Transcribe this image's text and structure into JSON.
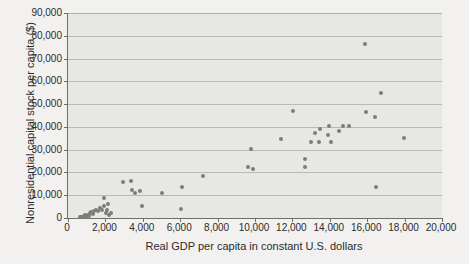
{
  "chart_data": {
    "type": "scatter",
    "title": "",
    "xlabel": "Real GDP per capita in constant U.S. dollars",
    "ylabel": "Nonresidential capital stock per capita ($)",
    "xlim": [
      0,
      20000
    ],
    "ylim": [
      0,
      90000
    ],
    "xticks": [
      0,
      2000,
      4000,
      6000,
      8000,
      10000,
      12000,
      14000,
      16000,
      18000,
      20000
    ],
    "yticks": [
      0,
      10000,
      20000,
      30000,
      40000,
      50000,
      60000,
      70000,
      80000,
      90000
    ],
    "xtick_labels": [
      "0",
      "2,000",
      "4,000",
      "6,000",
      "8,000",
      "10,000",
      "12,000",
      "14,000",
      "16,000",
      "18,000",
      "20,000"
    ],
    "ytick_labels": [
      "0",
      "10,000",
      "20,000",
      "30,000",
      "40,000",
      "50,000",
      "60,000",
      "70,000",
      "80,000",
      "90,000"
    ],
    "grid": true,
    "grid_axis": "y",
    "legend": false,
    "marker_color": "#7d7d7d",
    "plot_background": "#e7e7e4",
    "figure_background": "#f2f1ef",
    "series": [
      {
        "name": "countries",
        "points": [
          [
            620,
            300
          ],
          [
            700,
            500
          ],
          [
            760,
            250
          ],
          [
            860,
            700
          ],
          [
            900,
            1100
          ],
          [
            980,
            600
          ],
          [
            1050,
            1500
          ],
          [
            1120,
            900
          ],
          [
            1180,
            2100
          ],
          [
            1250,
            2600
          ],
          [
            1320,
            1800
          ],
          [
            1400,
            3000
          ],
          [
            1500,
            3500
          ],
          [
            1580,
            2900
          ],
          [
            1700,
            4200
          ],
          [
            1800,
            3300
          ],
          [
            1900,
            8700
          ],
          [
            1950,
            5400
          ],
          [
            2050,
            2200
          ],
          [
            2100,
            3400
          ],
          [
            2150,
            6100
          ],
          [
            2200,
            1500
          ],
          [
            2300,
            2400
          ],
          [
            2950,
            15800
          ],
          [
            3350,
            16200
          ],
          [
            3400,
            12300
          ],
          [
            3600,
            10900
          ],
          [
            3850,
            11700
          ],
          [
            3950,
            5300
          ],
          [
            5000,
            11000
          ],
          [
            6050,
            3900
          ],
          [
            6100,
            13500
          ],
          [
            7200,
            18600
          ],
          [
            9600,
            22300
          ],
          [
            9800,
            30200
          ],
          [
            9900,
            21400
          ],
          [
            11400,
            34700
          ],
          [
            12050,
            46800
          ],
          [
            12650,
            26100
          ],
          [
            12700,
            22200
          ],
          [
            13000,
            33200
          ],
          [
            13200,
            37200
          ],
          [
            13400,
            33500
          ],
          [
            13500,
            38900
          ],
          [
            13900,
            36500
          ],
          [
            13950,
            40400
          ],
          [
            14050,
            33200
          ],
          [
            14500,
            38300
          ],
          [
            14700,
            40200
          ],
          [
            15050,
            40500
          ],
          [
            15900,
            76500
          ],
          [
            15950,
            46400
          ],
          [
            16400,
            44300
          ],
          [
            16450,
            13400
          ],
          [
            16750,
            54800
          ],
          [
            17950,
            35100
          ]
        ]
      }
    ]
  }
}
